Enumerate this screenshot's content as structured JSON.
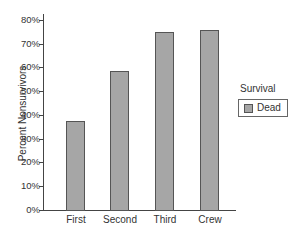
{
  "chart_data": {
    "type": "bar",
    "title": "",
    "xlabel": "",
    "ylabel": "Percent Nonsurvivors",
    "categories": [
      "First",
      "Second",
      "Third",
      "Crew"
    ],
    "series": [
      {
        "name": "Dead",
        "values": [
          37.5,
          58.6,
          74.8,
          76.0
        ],
        "color": "#a6a6a6"
      }
    ],
    "ylim": [
      0,
      80
    ],
    "yticks": [
      "0%",
      "10%",
      "20%",
      "30%",
      "40%",
      "50%",
      "60%",
      "70%",
      "80%"
    ],
    "grid": false,
    "legend": {
      "title": "Survival",
      "position": "right",
      "entries": [
        "Dead"
      ]
    }
  }
}
